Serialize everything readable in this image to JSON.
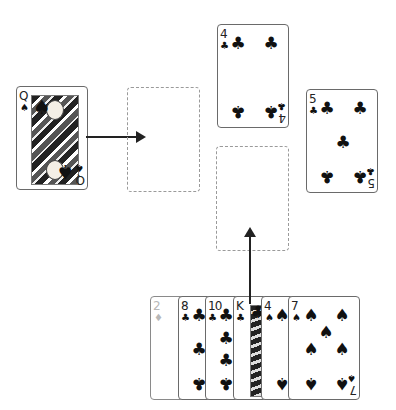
{
  "table": {
    "source_card": {
      "rank": "Q",
      "suit": "♠",
      "name": "queen-of-spades"
    },
    "foundation_top": {
      "rank": "4",
      "suit": "♣"
    },
    "foundation_right": {
      "rank": "5",
      "suit": "♣"
    },
    "empty_slots": [
      "target-slot-left",
      "target-slot-center"
    ]
  },
  "hand": {
    "cards": [
      {
        "rank": "2",
        "suit": "♦",
        "faded": true
      },
      {
        "rank": "8",
        "suit": "♣"
      },
      {
        "rank": "10",
        "suit": "♣"
      },
      {
        "rank": "K",
        "suit": "♣"
      },
      {
        "rank": "4",
        "suit": "♠"
      },
      {
        "rank": "7",
        "suit": "♠"
      }
    ]
  },
  "arrows": [
    {
      "from": "queen-of-spades",
      "to": "target-slot-left",
      "direction": "right"
    },
    {
      "from": "hand-card-king-clubs",
      "to": "target-slot-center",
      "direction": "up"
    }
  ],
  "colors": {
    "ink": "#111111",
    "border": "#6a6a6a",
    "dashed": "#9a9a9a",
    "faded": "#b8b8b8"
  }
}
